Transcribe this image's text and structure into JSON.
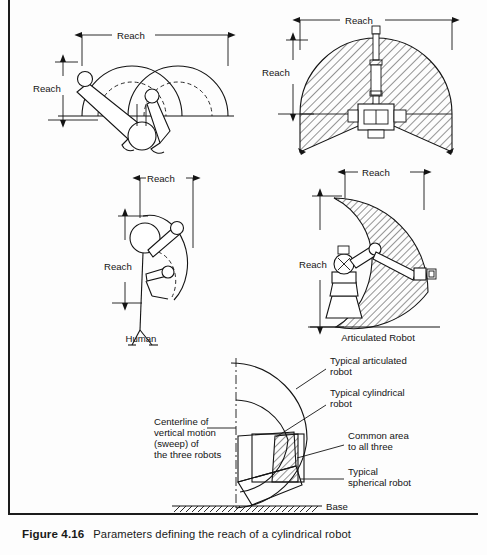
{
  "page": {
    "background_color": "#fdfdfd",
    "ink_color": "#141414"
  },
  "caption": {
    "figure_number": "Figure 4.16",
    "text": "Parameters defining the reach of a cylindrical robot"
  },
  "panels": {
    "top_left": {
      "name": "cylindrical-robot-plan-overlap",
      "horizontal_dimension_label": "Reach",
      "vertical_dimension_label": "Reach"
    },
    "top_right": {
      "name": "cylindrical-robot-work-envelope-plan",
      "horizontal_dimension_label": "Reach",
      "vertical_dimension_label": "Reach"
    },
    "middle_left": {
      "name": "human-reach-comparison",
      "horizontal_dimension_label": "Reach",
      "vertical_dimension_label": "Reach",
      "caption_label": "Human"
    },
    "middle_right": {
      "name": "articulated-robot-work-envelope",
      "horizontal_dimension_label": "Reach",
      "vertical_dimension_label": "Reach",
      "caption_label": "Articulated  Robot"
    },
    "bottom": {
      "name": "combined-work-envelopes",
      "labels": {
        "centerline": [
          "Centerline of",
          "vertical motion",
          "(sweep) of",
          "the three robots"
        ],
        "articulated": [
          "Typical articulated",
          "robot"
        ],
        "cylindrical": [
          "Typical cylindrical",
          "robot"
        ],
        "common_area": [
          "Common area",
          "to all three"
        ],
        "spherical": [
          "Typical",
          "spherical robot"
        ],
        "base": "Base"
      }
    }
  }
}
